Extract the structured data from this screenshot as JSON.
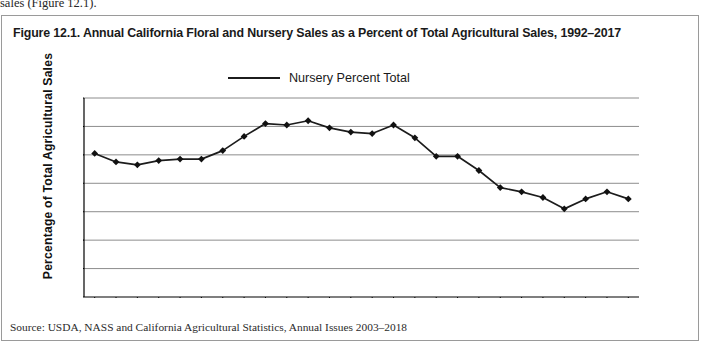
{
  "page": {
    "preceding_text": "sales (Figure 12.1)."
  },
  "figure": {
    "title": "Figure 12.1. Annual California Floral and Nursery Sales as a Percent of Total Agricultural Sales, 1992–2017",
    "source": "Source: USDA, NASS and California Agricultural Statistics, Annual Issues 2003–2018"
  },
  "colors": {
    "line": "#1c1c1c",
    "marker": "#111111",
    "grid": "#808080",
    "axis": "#000000",
    "frame": "#9a9a9a",
    "background": "#ffffff"
  },
  "chart_data": {
    "type": "line",
    "title": "Figure 12.1. Annual California Floral and Nursery Sales as a Percent of Total Agricultural Sales, 1992–2017",
    "xlabel": "",
    "ylabel": "Percentage of Total Agricultural Sales",
    "ylim": [
      0,
      14
    ],
    "yticks": [
      0,
      2,
      4,
      6,
      8,
      10,
      12,
      14
    ],
    "ytick_labels": [
      "0",
      "2",
      "4",
      "6",
      "8",
      "10",
      "12",
      "14"
    ],
    "grid": true,
    "grid_axis": "y",
    "legend_position": "top-center",
    "legend": [
      "Nursery Percent Total"
    ],
    "markers": true,
    "categories": [
      "1992",
      "1993",
      "1994",
      "1995",
      "1996",
      "1997",
      "1998",
      "1999",
      "2000",
      "2001",
      "2002",
      "2003",
      "2004",
      "2005",
      "2006",
      "2007",
      "2008",
      "2009",
      "2010",
      "2011",
      "2012",
      "2013",
      "2014",
      "2015",
      "2016",
      "2017"
    ],
    "series": [
      {
        "name": "Nursery Percent Total",
        "values": [
          10.1,
          9.5,
          9.3,
          9.6,
          9.7,
          9.7,
          10.3,
          11.3,
          12.2,
          12.1,
          12.4,
          11.9,
          11.6,
          11.5,
          12.1,
          11.2,
          9.9,
          9.9,
          8.9,
          7.7,
          7.4,
          7.0,
          6.2,
          6.9,
          7.4,
          6.9
        ]
      }
    ]
  }
}
